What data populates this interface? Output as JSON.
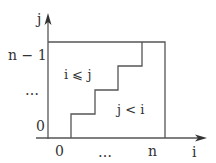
{
  "diagram": {
    "axes": {
      "x_label": "i",
      "y_label": "j"
    },
    "x_ticks": [
      "0",
      "…",
      "n"
    ],
    "y_ticks": [
      "0",
      "…",
      "n − 1"
    ],
    "regions": {
      "upper_left": "i ⩽ j",
      "lower_right": "j < i"
    },
    "staircase_steps": 4,
    "colors": {
      "line": "#555555",
      "text": "#333333",
      "background": "#ffffff"
    }
  }
}
